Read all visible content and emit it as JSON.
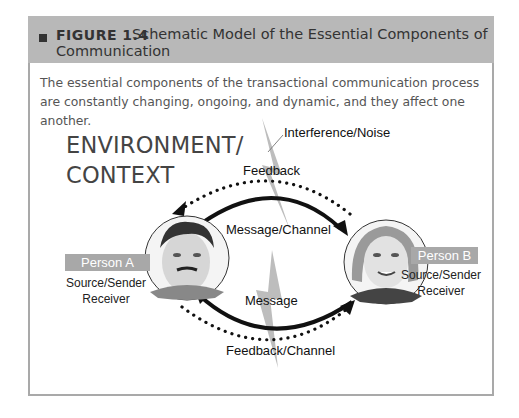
{
  "figure": {
    "number_label": "FIGURE 1.4",
    "title_line1": "Schematic Model of the Essential Components of",
    "title_line2": "Communication",
    "caption": "The essential components of the transactional communication process are constantly changing, ongoing, and dynamic, and they affect one another."
  },
  "diagram": {
    "environment_line1": "ENVIRONMENT/",
    "environment_line2": "CONTEXT",
    "interference": "Interference/Noise",
    "feedback_top": "Feedback",
    "message_channel": "Message/Channel",
    "message_bottom": "Message",
    "feedback_channel": "Feedback/Channel",
    "person_a": {
      "name": "Person A",
      "role1": "Source/Sender",
      "role2": "Receiver"
    },
    "person_b": {
      "name": "Person B",
      "role1": "Source/Sender",
      "role2": "Receiver"
    }
  },
  "colors": {
    "header_band": "#b8b8b8",
    "tag_bg": "#a8a8a8",
    "bolt": "#bdbdbd",
    "arrow": "#111111"
  }
}
